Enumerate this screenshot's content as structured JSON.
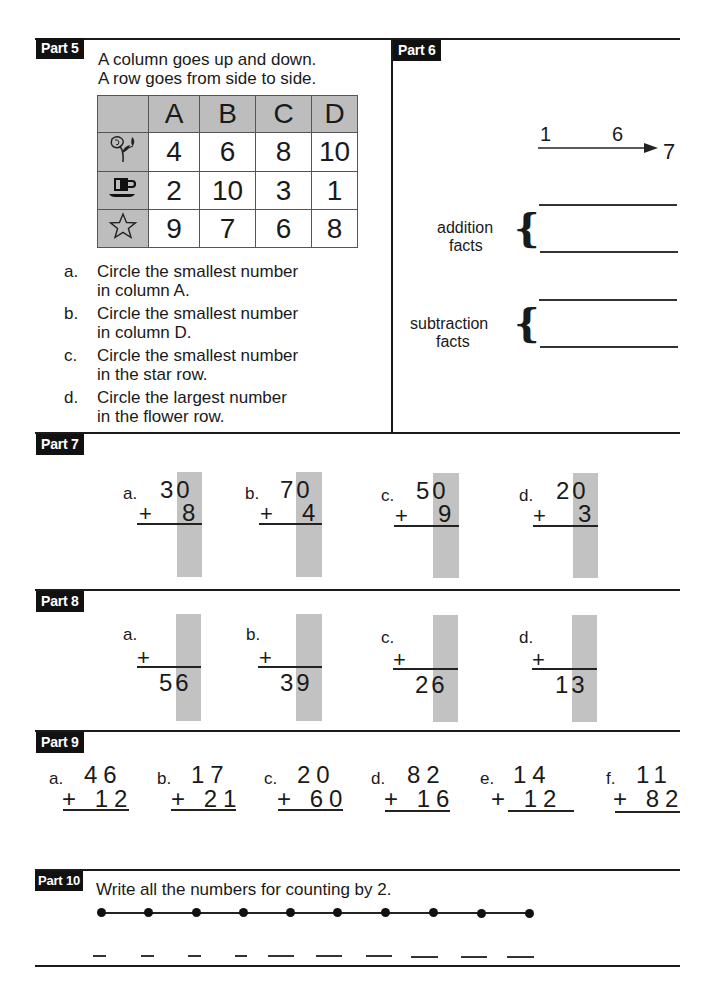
{
  "part5": {
    "label": "Part 5",
    "intro": [
      "A column goes up and down.",
      "A row goes from side to side."
    ],
    "table": {
      "columns": [
        "A",
        "B",
        "C",
        "D"
      ],
      "rows": [
        {
          "icon": "flower-icon",
          "values": [
            "4",
            "6",
            "8",
            "10"
          ]
        },
        {
          "icon": "cup-icon",
          "values": [
            "2",
            "10",
            "3",
            "1"
          ]
        },
        {
          "icon": "star-icon",
          "values": [
            "9",
            "7",
            "6",
            "8"
          ]
        }
      ]
    },
    "questions": [
      {
        "letter": "a.",
        "line1": "Circle the smallest number",
        "line2": "in column A."
      },
      {
        "letter": "b.",
        "line1": "Circle the smallest number",
        "line2": "in column D."
      },
      {
        "letter": "c.",
        "line1": "Circle the smallest number",
        "line2": "in the star row."
      },
      {
        "letter": "d.",
        "line1": "Circle the largest number",
        "line2": "in the flower row."
      }
    ]
  },
  "part6": {
    "label": "Part 6",
    "number_family": {
      "small1": "1",
      "small2": "6",
      "big": "7"
    },
    "addition_label": [
      "addition",
      "facts"
    ],
    "subtraction_label": [
      "subtraction",
      "facts"
    ]
  },
  "part7": {
    "label": "Part 7",
    "problems": [
      {
        "letter": "a.",
        "top": "30",
        "addend": "8"
      },
      {
        "letter": "b.",
        "top": "70",
        "addend": "4"
      },
      {
        "letter": "c.",
        "top": "50",
        "addend": "9"
      },
      {
        "letter": "d.",
        "top": "20",
        "addend": "3"
      }
    ]
  },
  "part8": {
    "label": "Part 8",
    "problems": [
      {
        "letter": "a.",
        "plus": "+",
        "answer": "56"
      },
      {
        "letter": "b.",
        "plus": "+",
        "answer": "39"
      },
      {
        "letter": "c.",
        "plus": "+",
        "answer": "26"
      },
      {
        "letter": "d.",
        "plus": "+",
        "answer": "13"
      }
    ]
  },
  "part9": {
    "label": "Part 9",
    "problems": [
      {
        "letter": "a.",
        "top": "46",
        "bottom": "+ 12"
      },
      {
        "letter": "b.",
        "top": "17",
        "bottom": "+ 21"
      },
      {
        "letter": "c.",
        "top": "20",
        "bottom": "+ 60"
      },
      {
        "letter": "d.",
        "top": "82",
        "bottom": "+ 16"
      },
      {
        "letter": "e.",
        "top": "14",
        "bottom": "+ 12"
      },
      {
        "letter": "f.",
        "top": "11",
        "bottom": "+ 82"
      }
    ]
  },
  "part10": {
    "label": "Part 10",
    "instruction": "Write all the numbers for counting by 2.",
    "dot_count": 10
  }
}
